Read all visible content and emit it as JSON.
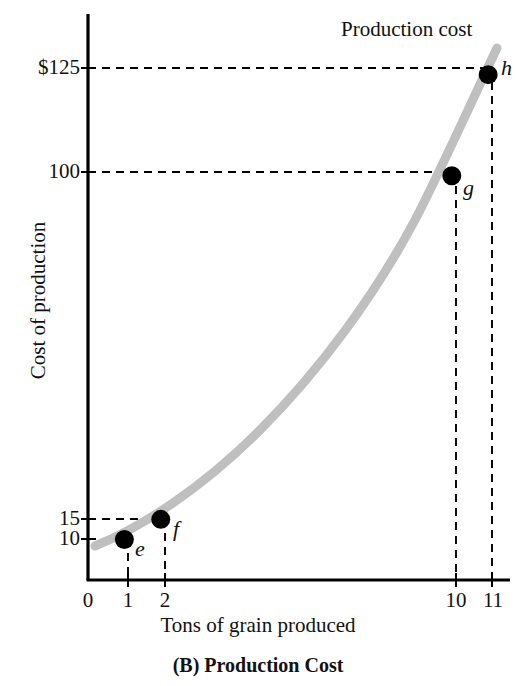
{
  "chart_data": {
    "type": "line",
    "title": "",
    "caption": "(B) Production Cost",
    "xlabel": "Tons of grain produced",
    "ylabel": "Cost of production",
    "series_label": "Production cost",
    "xlim": [
      0,
      11.6
    ],
    "ylim": [
      0,
      140
    ],
    "grid": false,
    "gridlines": "dashed leader lines from axes to labeled points only",
    "legend": "inline curve label at top right",
    "xticks": [
      "0",
      "1",
      "2",
      "10",
      "11"
    ],
    "xtick_values": [
      0,
      1,
      2,
      10,
      11
    ],
    "yticks": [
      "$125",
      "100",
      "15",
      "10"
    ],
    "ytick_values": [
      125,
      100,
      15,
      10
    ],
    "x": [
      1,
      2,
      10,
      11
    ],
    "values": [
      10,
      15,
      100,
      125
    ],
    "points": [
      {
        "label": "e",
        "x": 1,
        "y": 10
      },
      {
        "label": "f",
        "x": 2,
        "y": 15
      },
      {
        "label": "g",
        "x": 10,
        "y": 100
      },
      {
        "label": "h",
        "x": 11,
        "y": 125
      }
    ],
    "curve_color": "#bfbfbf",
    "point_color": "#000000",
    "axis_color": "#000000"
  },
  "labels": {
    "curve": "Production cost",
    "xaxis": "Tons of grain produced",
    "yaxis": "Cost of production",
    "caption": "(B) Production Cost",
    "ytick_125": "$125",
    "ytick_100": "100",
    "ytick_15": "15",
    "ytick_10": "10",
    "xtick_0": "0",
    "xtick_1": "1",
    "xtick_2": "2",
    "xtick_10": "10",
    "xtick_11": "11",
    "point_e": "e",
    "point_f": "f",
    "point_g": "g",
    "point_h": "h"
  }
}
